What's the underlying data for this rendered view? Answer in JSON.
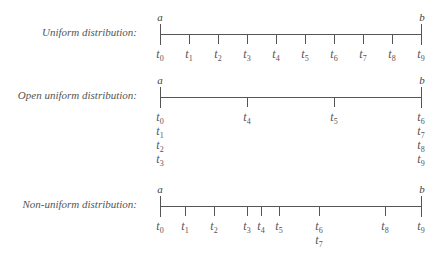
{
  "diagrams": [
    {
      "label": "Uniform distribution:",
      "start_label": "a",
      "end_label": "b",
      "line_y": 34,
      "x_start": 160,
      "x_end": 421,
      "knots": [
        {
          "x": 160,
          "labels": [
            "0"
          ]
        },
        {
          "x": 189,
          "labels": [
            "1"
          ]
        },
        {
          "x": 218,
          "labels": [
            "2"
          ]
        },
        {
          "x": 247,
          "labels": [
            "3"
          ]
        },
        {
          "x": 276,
          "labels": [
            "4"
          ]
        },
        {
          "x": 305,
          "labels": [
            "5"
          ]
        },
        {
          "x": 334,
          "labels": [
            "6"
          ]
        },
        {
          "x": 363,
          "labels": [
            "7"
          ]
        },
        {
          "x": 392,
          "labels": [
            "8"
          ]
        },
        {
          "x": 421,
          "labels": [
            "9"
          ]
        }
      ]
    },
    {
      "label": "Open uniform distribution:",
      "start_label": "a",
      "end_label": "b",
      "line_y": 97,
      "x_start": 160,
      "x_end": 421,
      "knots": [
        {
          "x": 160,
          "labels": [
            "0",
            "1",
            "2",
            "3"
          ]
        },
        {
          "x": 247,
          "labels": [
            "4"
          ]
        },
        {
          "x": 334,
          "labels": [
            "5"
          ]
        },
        {
          "x": 421,
          "labels": [
            "6",
            "7",
            "8",
            "9"
          ]
        }
      ]
    },
    {
      "label": "Non-uniform distribution:",
      "start_label": "a",
      "end_label": "b",
      "line_y": 206,
      "x_start": 160,
      "x_end": 421,
      "knots": [
        {
          "x": 160,
          "labels": [
            "0"
          ]
        },
        {
          "x": 185,
          "labels": [
            "1"
          ]
        },
        {
          "x": 214,
          "labels": [
            "2"
          ]
        },
        {
          "x": 247,
          "labels": [
            "3"
          ]
        },
        {
          "x": 261,
          "labels": [
            "4"
          ]
        },
        {
          "x": 279,
          "labels": [
            "5"
          ]
        },
        {
          "x": 319,
          "labels": [
            "6",
            "7"
          ]
        },
        {
          "x": 385,
          "labels": [
            "8"
          ]
        },
        {
          "x": 421,
          "labels": [
            "9"
          ]
        }
      ]
    }
  ],
  "symbol": "t"
}
